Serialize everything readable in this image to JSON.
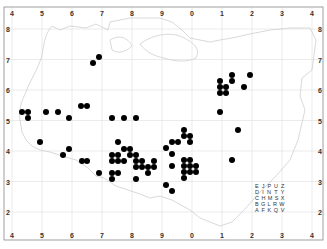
{
  "map": {
    "type": "dot distribution map",
    "colors": {
      "dot": "#000000",
      "grid": "#dddddd",
      "coast": "#cccccc",
      "frame": "#888888",
      "background": "#ffffff"
    },
    "col_labels": [
      "4",
      "5",
      "6",
      "7",
      "8",
      "9",
      "0",
      "1",
      "2",
      "3",
      "4"
    ],
    "row_labels": [
      "8",
      "7",
      "6",
      "5",
      "4",
      "3",
      "2"
    ],
    "legend_grid": [
      [
        "E",
        "J",
        "P",
        "U",
        "Z"
      ],
      [
        "D",
        "I",
        "N",
        "T",
        "Y"
      ],
      [
        "C",
        "H",
        "M",
        "S",
        "X"
      ],
      [
        "B",
        "G",
        "L",
        "R",
        "W"
      ],
      [
        "A",
        "F",
        "K",
        "Q",
        "V"
      ]
    ],
    "dots": [
      [
        99,
        57
      ],
      [
        93,
        63
      ],
      [
        220,
        81
      ],
      [
        220,
        87
      ],
      [
        226,
        87
      ],
      [
        220,
        93
      ],
      [
        226,
        93
      ],
      [
        232,
        75
      ],
      [
        232,
        81
      ],
      [
        250,
        75
      ],
      [
        244,
        87
      ],
      [
        220,
        112
      ],
      [
        81,
        106
      ],
      [
        87,
        106
      ],
      [
        22,
        112
      ],
      [
        28,
        112
      ],
      [
        28,
        118
      ],
      [
        46,
        112
      ],
      [
        58,
        112
      ],
      [
        69,
        118
      ],
      [
        112,
        118
      ],
      [
        124,
        118
      ],
      [
        136,
        118
      ],
      [
        40,
        142
      ],
      [
        63,
        155
      ],
      [
        69,
        149
      ],
      [
        82,
        161
      ],
      [
        87,
        161
      ],
      [
        99,
        173
      ],
      [
        112,
        155
      ],
      [
        118,
        155
      ],
      [
        118,
        142
      ],
      [
        112,
        161
      ],
      [
        118,
        161
      ],
      [
        124,
        161
      ],
      [
        124,
        149
      ],
      [
        130,
        149
      ],
      [
        130,
        155
      ],
      [
        136,
        155
      ],
      [
        136,
        161
      ],
      [
        142,
        161
      ],
      [
        154,
        161
      ],
      [
        136,
        167
      ],
      [
        142,
        167
      ],
      [
        148,
        167
      ],
      [
        154,
        167
      ],
      [
        112,
        173
      ],
      [
        118,
        173
      ],
      [
        148,
        173
      ],
      [
        112,
        179
      ],
      [
        136,
        179
      ],
      [
        184,
        130
      ],
      [
        184,
        136
      ],
      [
        190,
        136
      ],
      [
        190,
        142
      ],
      [
        172,
        142
      ],
      [
        178,
        142
      ],
      [
        166,
        148
      ],
      [
        172,
        154
      ],
      [
        238,
        130
      ],
      [
        232,
        160
      ],
      [
        172,
        166
      ],
      [
        184,
        160
      ],
      [
        190,
        160
      ],
      [
        184,
        166
      ],
      [
        190,
        166
      ],
      [
        196,
        166
      ],
      [
        184,
        172
      ],
      [
        190,
        172
      ],
      [
        196,
        172
      ],
      [
        184,
        178
      ],
      [
        166,
        185
      ],
      [
        172,
        191
      ]
    ]
  }
}
